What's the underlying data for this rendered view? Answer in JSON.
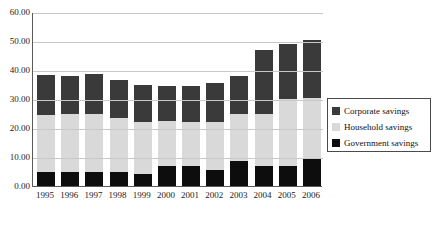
{
  "chart_data": {
    "type": "bar",
    "stacked": true,
    "title": "",
    "subtitle": "",
    "xlabel": "",
    "ylabel": "",
    "grid": true,
    "legend_position": "right",
    "ylim": [
      0,
      60
    ],
    "ytick_labels": [
      "60.00",
      "50.00",
      "40.00",
      "30.00",
      "20.00",
      "10.00",
      "0.00"
    ],
    "ytick_values": [
      60,
      50,
      40,
      30,
      20,
      10,
      0
    ],
    "categories": [
      "1995",
      "1996",
      "1997",
      "1998",
      "1999",
      "2000",
      "2001",
      "2002",
      "2003",
      "2004",
      "2005",
      "2006"
    ],
    "series": [
      {
        "name": "Government savings",
        "color": "#0d0d0d",
        "values": [
          5.0,
          5.0,
          5.0,
          5.0,
          4.0,
          7.0,
          7.0,
          5.5,
          8.5,
          7.0,
          7.0,
          9.5
        ]
      },
      {
        "name": "Household savings",
        "color": "#d9d9d9",
        "values": [
          19.5,
          20.0,
          20.0,
          18.5,
          18.0,
          15.5,
          15.0,
          16.5,
          16.5,
          18.0,
          23.0,
          21.0
        ]
      },
      {
        "name": "Corporate savings",
        "color": "#3a3a3a",
        "values": [
          13.8,
          13.0,
          13.5,
          13.0,
          13.0,
          12.0,
          12.5,
          13.5,
          13.0,
          22.0,
          18.8,
          20.0
        ]
      }
    ],
    "totals": [
      38.3,
      38.0,
      38.5,
      36.5,
      35.0,
      34.5,
      34.5,
      35.5,
      38.0,
      47.0,
      48.8,
      50.5
    ]
  },
  "legend": {
    "items": [
      {
        "label": "Corporate savings",
        "color": "#3a3a3a"
      },
      {
        "label": "Household savings",
        "color": "#d9d9d9"
      },
      {
        "label": "Government savings",
        "color": "#0d0d0d"
      }
    ]
  }
}
